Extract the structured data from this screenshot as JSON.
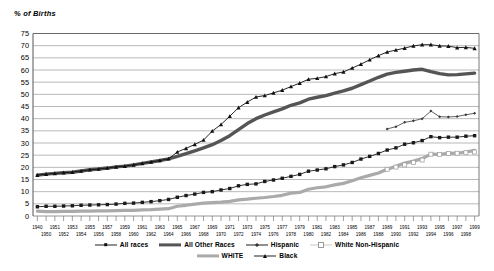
{
  "chart_data": {
    "type": "line",
    "title": "",
    "ylabel": "% of Births",
    "xlabel": "",
    "ylim": [
      0,
      75
    ],
    "ytick_step": 5,
    "yticks": [
      "0",
      "5",
      "10",
      "15",
      "20",
      "25",
      "30",
      "35",
      "40",
      "45",
      "50",
      "55",
      "60",
      "65",
      "70",
      "75"
    ],
    "grid": true,
    "legend_position": "bottom",
    "x_start": 1940,
    "x_end": 1999,
    "x_labels_top": [
      "1940",
      "1951",
      "1953",
      "1955",
      "1957",
      "1959",
      "1961",
      "1963",
      "1965",
      "1967",
      "1969",
      "1971",
      "1973",
      "1975",
      "1977",
      "1979",
      "1981",
      "1983",
      "1985",
      "1987",
      "1989",
      "1991",
      "1993",
      "1995",
      "1997",
      "1999"
    ],
    "x_labels_bottom": [
      "1950",
      "1952",
      "1954",
      "1956",
      "1958",
      "1960",
      "1962",
      "1964",
      "1966",
      "1968",
      "1970",
      "1972",
      "1974",
      "1976",
      "1978",
      "1980",
      "1982",
      "1984",
      "1986",
      "1988",
      "1990",
      "1992",
      "1994",
      "1996",
      "1998"
    ],
    "series": [
      {
        "name": "All races",
        "marker": "filled-square",
        "color": "#1a1a1a",
        "x": [
          1940,
          1950,
          1951,
          1952,
          1953,
          1954,
          1955,
          1956,
          1957,
          1958,
          1959,
          1960,
          1961,
          1962,
          1963,
          1964,
          1965,
          1966,
          1967,
          1968,
          1969,
          1970,
          1971,
          1972,
          1973,
          1974,
          1975,
          1976,
          1977,
          1978,
          1979,
          1980,
          1981,
          1982,
          1983,
          1984,
          1985,
          1986,
          1987,
          1988,
          1989,
          1990,
          1991,
          1992,
          1993,
          1994,
          1995,
          1996,
          1997,
          1998,
          1999
        ],
        "values": [
          3.8,
          4.0,
          4.0,
          4.1,
          4.2,
          4.4,
          4.5,
          4.6,
          4.7,
          4.9,
          5.2,
          5.3,
          5.6,
          5.9,
          6.3,
          6.8,
          7.7,
          8.4,
          9.0,
          9.7,
          10.0,
          10.7,
          11.3,
          12.4,
          13.0,
          13.2,
          14.2,
          14.8,
          15.5,
          16.3,
          17.1,
          18.4,
          18.9,
          19.4,
          20.3,
          21.0,
          22.0,
          23.4,
          24.5,
          25.7,
          27.1,
          28.0,
          29.5,
          30.1,
          31.0,
          32.6,
          32.2,
          32.4,
          32.4,
          32.8,
          33.0
        ]
      },
      {
        "name": "All Other Races",
        "marker": "none",
        "color": "#555555",
        "x": [
          1940,
          1950,
          1951,
          1952,
          1953,
          1954,
          1955,
          1956,
          1957,
          1958,
          1959,
          1960,
          1961,
          1962,
          1963,
          1964,
          1965,
          1966,
          1967,
          1968,
          1969,
          1970,
          1971,
          1972,
          1973,
          1974,
          1975,
          1976,
          1977,
          1978,
          1979,
          1980,
          1981,
          1982,
          1983,
          1984,
          1985,
          1986,
          1987,
          1988,
          1989,
          1990,
          1991,
          1992,
          1993,
          1994,
          1995,
          1996,
          1997,
          1998,
          1999
        ],
        "values": [
          16.8,
          17.2,
          17.5,
          17.8,
          18.0,
          18.5,
          19.0,
          19.3,
          19.7,
          20.2,
          20.5,
          21.0,
          21.6,
          22.2,
          22.8,
          23.5,
          24.5,
          25.6,
          26.8,
          28.0,
          29.3,
          31.0,
          33.0,
          35.5,
          38.0,
          40.0,
          41.5,
          42.8,
          44.0,
          45.5,
          46.5,
          48.0,
          48.8,
          49.5,
          50.5,
          51.4,
          52.5,
          54.0,
          55.5,
          57.0,
          58.3,
          59.0,
          59.5,
          60.0,
          60.3,
          59.3,
          58.5,
          58.0,
          58.1,
          58.4,
          58.7
        ]
      },
      {
        "name": "Hispanic",
        "marker": "small-diamond",
        "color": "#3a3a3a",
        "x": [
          1989,
          1990,
          1991,
          1992,
          1993,
          1994,
          1995,
          1996,
          1997,
          1998,
          1999
        ],
        "values": [
          35.8,
          36.7,
          38.5,
          39.1,
          40.0,
          43.1,
          40.8,
          40.7,
          40.9,
          41.6,
          42.2
        ]
      },
      {
        "name": "White Non-Hispanic",
        "marker": "open-square",
        "color": "#aaaaaa",
        "x": [
          1989,
          1990,
          1991,
          1992,
          1993,
          1994,
          1995,
          1996,
          1997,
          1998,
          1999
        ],
        "values": [
          19.2,
          20.1,
          21.0,
          22.0,
          23.0,
          25.4,
          25.3,
          25.7,
          25.8,
          26.0,
          26.3
        ]
      },
      {
        "name": "WHITE",
        "marker": "none",
        "color": "#aaaaaa",
        "x": [
          1940,
          1950,
          1951,
          1952,
          1953,
          1954,
          1955,
          1956,
          1957,
          1958,
          1959,
          1960,
          1961,
          1962,
          1963,
          1964,
          1965,
          1966,
          1967,
          1968,
          1969,
          1970,
          1971,
          1972,
          1973,
          1974,
          1975,
          1976,
          1977,
          1978,
          1979,
          1980,
          1981,
          1982,
          1983,
          1984,
          1985,
          1986,
          1987,
          1988,
          1989,
          1990,
          1991,
          1992,
          1993,
          1994,
          1995,
          1996,
          1997,
          1998,
          1999
        ],
        "values": [
          2.0,
          1.8,
          1.8,
          1.9,
          1.9,
          2.0,
          2.0,
          2.1,
          2.1,
          2.2,
          2.3,
          2.3,
          2.5,
          2.6,
          2.8,
          3.0,
          4.0,
          4.4,
          4.9,
          5.3,
          5.5,
          5.7,
          6.0,
          6.6,
          6.9,
          7.3,
          7.6,
          8.0,
          8.5,
          9.4,
          9.7,
          11.0,
          11.6,
          12.0,
          12.8,
          13.4,
          14.5,
          15.7,
          16.7,
          17.7,
          19.2,
          20.4,
          21.8,
          22.6,
          23.6,
          25.4,
          25.3,
          25.7,
          25.8,
          26.3,
          27.0
        ]
      },
      {
        "name": "Black",
        "marker": "triangle",
        "color": "#111111",
        "x": [
          1940,
          1950,
          1951,
          1952,
          1953,
          1954,
          1955,
          1956,
          1957,
          1958,
          1959,
          1960,
          1961,
          1962,
          1963,
          1964,
          1965,
          1966,
          1967,
          1968,
          1969,
          1970,
          1971,
          1972,
          1973,
          1974,
          1975,
          1976,
          1977,
          1978,
          1979,
          1980,
          1981,
          1982,
          1983,
          1984,
          1985,
          1986,
          1987,
          1988,
          1989,
          1990,
          1991,
          1992,
          1993,
          1994,
          1995,
          1996,
          1997,
          1998,
          1999
        ],
        "values": [
          16.8,
          17.2,
          17.5,
          17.8,
          18.0,
          18.5,
          19.0,
          19.3,
          19.7,
          20.2,
          20.5,
          21.0,
          21.6,
          22.2,
          22.8,
          23.5,
          26.3,
          27.8,
          29.4,
          31.2,
          34.9,
          37.6,
          41.0,
          44.5,
          46.8,
          48.9,
          49.5,
          50.6,
          51.7,
          53.2,
          54.6,
          56.2,
          56.6,
          57.3,
          58.5,
          59.2,
          60.8,
          62.4,
          64.2,
          65.9,
          67.4,
          68.2,
          69.0,
          69.9,
          70.4,
          70.4,
          69.9,
          69.8,
          69.2,
          69.3,
          68.9
        ]
      }
    ]
  },
  "legend": {
    "rows": [
      [
        {
          "label": "All races",
          "key": "line-filled-square"
        },
        {
          "label": "All Other Races",
          "key": "thick-line"
        },
        {
          "label": "Hispanic",
          "key": "line-diamond"
        },
        {
          "label": "White Non-Hispanic",
          "key": "light-open-square"
        }
      ],
      [
        {
          "label": "WHITE",
          "key": "thick-light-line"
        },
        {
          "label": "Black",
          "key": "line-triangle"
        }
      ]
    ]
  }
}
